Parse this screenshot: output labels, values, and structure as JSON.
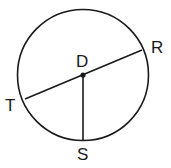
{
  "diagram": {
    "type": "circle-geometry",
    "center": {
      "label": "D",
      "x": 83,
      "y": 75
    },
    "radius": 66,
    "points": [
      {
        "label": "R",
        "x": 142,
        "y": 50
      },
      {
        "label": "T",
        "x": 25,
        "y": 99
      },
      {
        "label": "S",
        "x": 83,
        "y": 141
      }
    ],
    "segments": [
      {
        "from": "T",
        "to": "R",
        "kind": "diameter"
      },
      {
        "from": "D",
        "to": "S",
        "kind": "radius"
      }
    ],
    "colors": {
      "stroke": "#1a1a1a",
      "background": "#ffffff"
    }
  }
}
